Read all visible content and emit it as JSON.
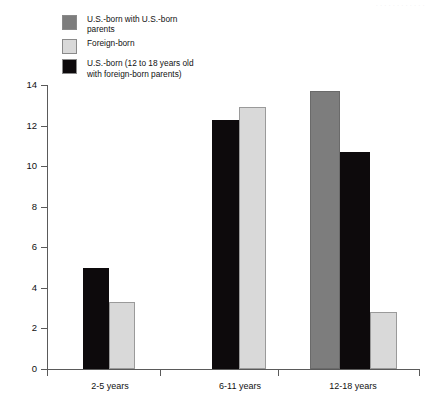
{
  "artifact_text": "· · · · · · · · · · · ·",
  "legend": {
    "items": [
      {
        "label": "U.S.-born with U.S.-born\nparents",
        "color": "#7d7d7d",
        "key": "us_born_us_parents"
      },
      {
        "label": "Foreign-born",
        "color": "#d9d9d9",
        "key": "foreign_born"
      },
      {
        "label": "U.S.-born (12 to 18 years old\nwith foreign-born parents)",
        "color": "#0d0a0c",
        "key": "us_born_foreign_parents"
      }
    ]
  },
  "axis": {
    "y_ticks": [
      "0",
      "2",
      "4",
      "6",
      "8",
      "10",
      "12",
      "14"
    ],
    "x_labels": [
      "2-5 years",
      "6-11 years",
      "12-18 years"
    ]
  },
  "chart_data": {
    "type": "bar",
    "title": "",
    "xlabel": "",
    "ylabel": "",
    "ylim": [
      0,
      14
    ],
    "grid": false,
    "legend_position": "top-left",
    "categories": [
      "2-5 years",
      "6-11 years",
      "12-18 years"
    ],
    "series": [
      {
        "name": "U.S.-born with U.S.-born parents",
        "color": "#7d7d7d",
        "values": [
          null,
          null,
          13.7
        ]
      },
      {
        "name": "Foreign-born",
        "color": "#d9d9d9",
        "values": [
          3.3,
          12.9,
          2.8
        ]
      },
      {
        "name": "U.S.-born (12 to 18 years old with foreign-born parents)",
        "color": "#0d0a0c",
        "values": [
          5.0,
          12.3,
          10.7
        ]
      }
    ],
    "bars": [
      {
        "group": "2-5 years",
        "series": "U.S.-born (12 to 18 years old with foreign-born parents)",
        "value": 5.0,
        "color": "#0d0a0c",
        "x": 83,
        "w": 26
      },
      {
        "group": "2-5 years",
        "series": "Foreign-born",
        "value": 3.3,
        "color": "#d9d9d9",
        "x": 109,
        "w": 26
      },
      {
        "group": "6-11 years",
        "series": "U.S.-born (12 to 18 years old with foreign-born parents)",
        "value": 12.3,
        "color": "#0d0a0c",
        "x": 212,
        "w": 27
      },
      {
        "group": "6-11 years",
        "series": "Foreign-born",
        "value": 12.9,
        "color": "#d9d9d9",
        "x": 239,
        "w": 27
      },
      {
        "group": "12-18 years",
        "series": "U.S.-born with U.S.-born parents",
        "value": 13.7,
        "color": "#7d7d7d",
        "x": 310,
        "w": 30
      },
      {
        "group": "12-18 years",
        "series": "U.S.-born (12 to 18 years old with foreign-born parents)",
        "value": 10.7,
        "color": "#0d0a0c",
        "x": 340,
        "w": 30
      },
      {
        "group": "12-18 years",
        "series": "Foreign-born",
        "value": 2.8,
        "color": "#d9d9d9",
        "x": 370,
        "w": 27
      }
    ],
    "group_centers": [
      110,
      240,
      353
    ],
    "group_boundaries": [
      47,
      160,
      278,
      419
    ]
  }
}
